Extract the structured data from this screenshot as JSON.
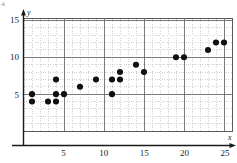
{
  "figure": {
    "corner_mark": "4.",
    "x_axis_name": "x",
    "y_axis_name": "y"
  },
  "chart_data": {
    "type": "scatter",
    "title": "",
    "xlabel": "x",
    "ylabel": "y",
    "xlim": [
      0,
      26
    ],
    "ylim": [
      0,
      15.2
    ],
    "xticks": [
      5,
      10,
      15,
      20,
      25
    ],
    "yticks": [
      5,
      10,
      15
    ],
    "x_minor_step": 1,
    "y_minor_step": 1,
    "grid": true,
    "grid_major_color": "#6b6b6b",
    "grid_minor_color": "#bdbdbd",
    "point_color": "#111111",
    "point_size": 3.1,
    "legend": null,
    "points": [
      {
        "x": 1,
        "y": 5
      },
      {
        "x": 1,
        "y": 4
      },
      {
        "x": 3,
        "y": 4
      },
      {
        "x": 4,
        "y": 7
      },
      {
        "x": 4,
        "y": 5
      },
      {
        "x": 4,
        "y": 4
      },
      {
        "x": 5,
        "y": 5
      },
      {
        "x": 7,
        "y": 6
      },
      {
        "x": 9,
        "y": 7
      },
      {
        "x": 11,
        "y": 7
      },
      {
        "x": 11,
        "y": 5
      },
      {
        "x": 12,
        "y": 8
      },
      {
        "x": 12,
        "y": 7
      },
      {
        "x": 14,
        "y": 9
      },
      {
        "x": 15,
        "y": 8
      },
      {
        "x": 19,
        "y": 10
      },
      {
        "x": 20,
        "y": 10
      },
      {
        "x": 23,
        "y": 11
      },
      {
        "x": 24,
        "y": 12
      },
      {
        "x": 25,
        "y": 12
      }
    ]
  }
}
